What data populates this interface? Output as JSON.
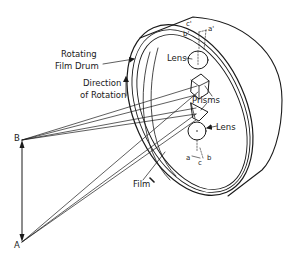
{
  "diagram": {
    "type": "technical-illustration",
    "colors": {
      "ink": "#1a1a1a",
      "background": "#ffffff"
    },
    "labels": {
      "rotating": "Rotating",
      "film_drum": "Film Drum",
      "direction": "Direction",
      "of_rotation": "of Rotation",
      "lens_top": "Lens",
      "prisms": "Prisms",
      "lens_bottom": "Lens",
      "film": "Film",
      "point_b": "B",
      "point_a": "A",
      "c_prime": "c'",
      "b_prime": "b'",
      "a_prime": "a'",
      "a": "a",
      "c": "c",
      "b": "b"
    }
  }
}
